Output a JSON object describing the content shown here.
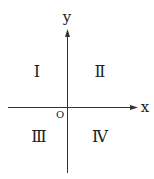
{
  "diagram": {
    "type": "coordinate-plane",
    "axes": {
      "x_label": "x",
      "y_label": "y",
      "origin_label": "O"
    },
    "quadrants": [
      {
        "label": "Ⅰ",
        "position": "upper-left"
      },
      {
        "label": "Ⅱ",
        "position": "upper-right"
      },
      {
        "label": "Ⅲ",
        "position": "lower-left"
      },
      {
        "label": "Ⅳ",
        "position": "lower-right"
      }
    ],
    "colors": {
      "line": "#333333",
      "text": "#222222",
      "background": "#ffffff"
    }
  }
}
